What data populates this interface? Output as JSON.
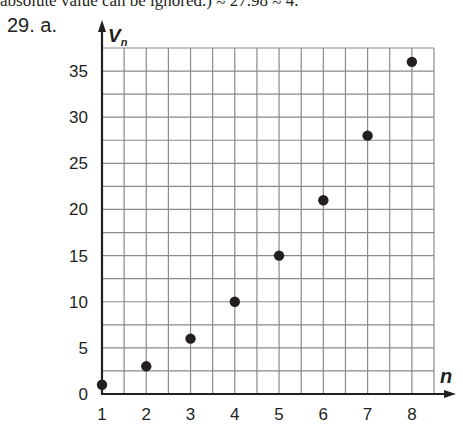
{
  "header": {
    "top_text": "absolute value can be ignored.) ≈ 27.98 ≈ 4.",
    "problem_label": "29. a."
  },
  "chart_data": {
    "type": "scatter",
    "title": "",
    "xlabel": "n",
    "ylabel": "V_n",
    "ylabel_main": "V",
    "ylabel_sub": "n",
    "x": [
      1,
      2,
      3,
      4,
      5,
      6,
      7,
      8
    ],
    "y": [
      1,
      3,
      6,
      10,
      15,
      21,
      28,
      36
    ],
    "xlim": [
      1,
      8.5
    ],
    "ylim": [
      0,
      37.5
    ],
    "x_ticks": [
      "1",
      "2",
      "3",
      "4",
      "5",
      "6",
      "7",
      "8"
    ],
    "y_ticks": [
      "0",
      "5",
      "10",
      "15",
      "20",
      "25",
      "30",
      "35"
    ],
    "grid": true,
    "grid_x_step": 0.5,
    "grid_y_step": 2.5,
    "legend": null,
    "marker_color": "#231f20",
    "grid_color": "#8a8a8a"
  }
}
